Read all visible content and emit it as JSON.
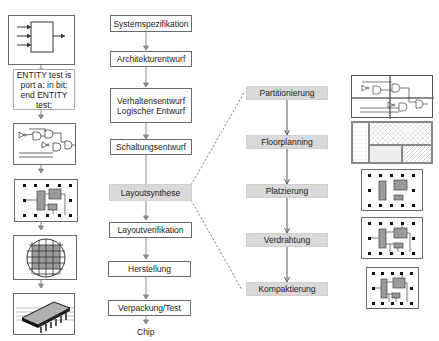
{
  "left_column": {
    "items": [
      {
        "type": "block-symbol-icon"
      },
      {
        "type": "vhdl-code",
        "lines": [
          "ENTITY test is",
          "port a: in bit;",
          "end ENTITY test;"
        ]
      },
      {
        "type": "gate-schematic-icon"
      },
      {
        "type": "layout-icon"
      },
      {
        "type": "wafer-icon"
      },
      {
        "type": "chip-package-icon"
      }
    ]
  },
  "main_flow": {
    "steps": [
      {
        "label": "Systemspezifikation"
      },
      {
        "label": "Architekturentwurf"
      },
      {
        "label": "Verhaltensentwurf\nLogischer Entwurf",
        "line1": "Verhaltensentwurf",
        "line2": "Logischer Entwurf"
      },
      {
        "label": "Schaltungsentwurf"
      },
      {
        "label": "Layoutsynthese",
        "highlighted": true
      },
      {
        "label": "Layoutverifikation"
      },
      {
        "label": "Herstellung"
      },
      {
        "label": "Verpackung/Test"
      }
    ],
    "output": "Chip"
  },
  "layout_synthesis_flow": {
    "steps": [
      {
        "label": "Partitionierung"
      },
      {
        "label": "Floorplanning"
      },
      {
        "label": "Platzierung"
      },
      {
        "label": "Verdrahtung"
      },
      {
        "label": "Kompaktierung"
      }
    ]
  },
  "right_column": {
    "items": [
      {
        "type": "partitioned-schematic-icon"
      },
      {
        "type": "floorplan-icon"
      },
      {
        "type": "placement-icon"
      },
      {
        "type": "routing-icon"
      },
      {
        "type": "compacted-layout-icon"
      }
    ]
  },
  "colors": {
    "border": "#6a6a6a",
    "highlight_fill": "#d9d9d9",
    "arrow": "#7a7a7a",
    "cell_fill": "#9a9a9a"
  }
}
